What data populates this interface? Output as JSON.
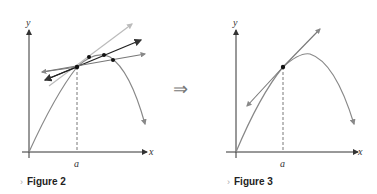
{
  "figures": [
    {
      "id": "figure-2",
      "caption": "Figure 2",
      "x_label": "x",
      "y_label": "y",
      "point_label": "a",
      "description": "Curve with several secant lines through point at a converging toward tangent"
    },
    {
      "id": "figure-3",
      "caption": "Figure 3",
      "x_label": "x",
      "y_label": "y",
      "point_label": "a",
      "description": "Curve with tangent line at point a"
    }
  ],
  "implies_symbol": "⇒",
  "caption_marker": "›",
  "colors": {
    "curve": "#888888",
    "secant_dark": "#222222",
    "secant_light": "#bbbbbb",
    "axis": "#333333"
  }
}
